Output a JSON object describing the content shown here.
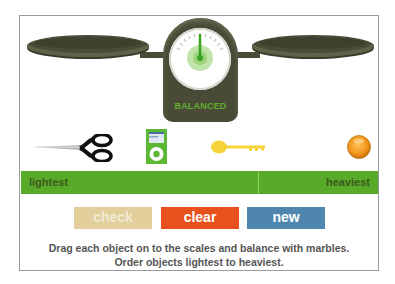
{
  "scale": {
    "status": "BALANCED",
    "status_color": "#5fae2c",
    "body_color": "#4a4b37",
    "needle_color": "#3aa020"
  },
  "objects": [
    {
      "name": "scissors",
      "icon": "scissors-icon"
    },
    {
      "name": "ipod",
      "icon": "ipod-icon"
    },
    {
      "name": "key",
      "icon": "key-icon"
    },
    {
      "name": "marble",
      "icon": "marble-icon"
    }
  ],
  "order_bar": {
    "left_label": "lightest",
    "right_label": "heaviest",
    "color": "#5aaa2a"
  },
  "buttons": {
    "check": {
      "label": "check",
      "color": "#e2cf9c"
    },
    "clear": {
      "label": "clear",
      "color": "#e8501c"
    },
    "new": {
      "label": "new",
      "color": "#4f86ad"
    }
  },
  "instructions": {
    "line1": "Drag each object on to the scales and balance with marbles.",
    "line2": "Order objects lightest to heaviest."
  }
}
